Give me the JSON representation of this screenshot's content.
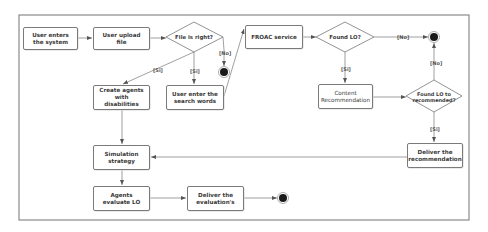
{
  "diagram": {
    "type": "uml-activity-diagram",
    "nodes": {
      "enter_system": "User enters the system",
      "upload_file": "User  upload file",
      "file_right": "File is right?",
      "create_agents": "Create agents with disabilities",
      "search_words": "User enter the search words",
      "froac": "FROAC service",
      "found_lo": "Found LO?",
      "content_rec": "Content Recommendation",
      "found_lo_rec": "Found LO to recommended?",
      "deliver_rec": "Deliver the recommendation",
      "simulation": "Simulation strategy",
      "agents_eval": "Agents evaluate LO",
      "deliver_eval": "Deliver the evaluation's"
    },
    "guards": {
      "file_no": "[No]",
      "file_yes_agents": "[Si]",
      "file_yes_search": "[Si]",
      "found_no": "[No]",
      "found_yes": "[Si]",
      "rec_no": "[No]",
      "rec_yes": "[Si]"
    },
    "colors": {
      "stroke": "#7a7a7a",
      "text": "#3a3a3a",
      "end_fill": "#1a1a1a",
      "frame": "#8a8a8a"
    }
  }
}
